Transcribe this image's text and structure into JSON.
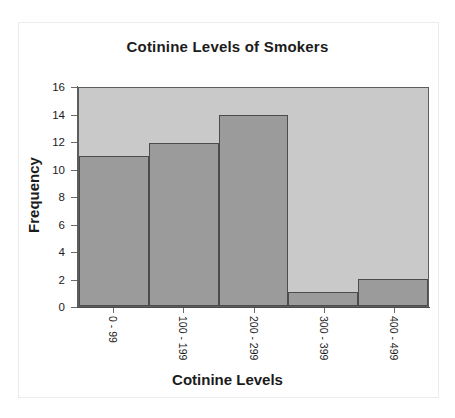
{
  "chart_data": {
    "type": "bar",
    "title": "Cotinine Levels of Smokers",
    "xlabel": "Cotinine Levels",
    "ylabel": "Frequency",
    "categories": [
      "0 - 99",
      "100 - 199",
      "200 - 299",
      "300 - 399",
      "400 - 499"
    ],
    "values": [
      11,
      12,
      14,
      1,
      2
    ],
    "ylim": [
      0,
      16
    ],
    "ytick_labels": [
      "16",
      "14",
      "12",
      "10",
      "8",
      "6",
      "4",
      "2",
      "0"
    ],
    "ytick_values": [
      16,
      14,
      12,
      10,
      8,
      6,
      4,
      2,
      0
    ],
    "grid": false,
    "legend": "none",
    "xtick_rotation": 90,
    "colors": {
      "bar_fill": "#9b9b9b",
      "bar_border": "#4c4c4c",
      "plot_background": "#c9c9c9",
      "axis": "#5d5d5d",
      "text": "#1c1c1c",
      "figure_background": "#ffffff"
    }
  }
}
